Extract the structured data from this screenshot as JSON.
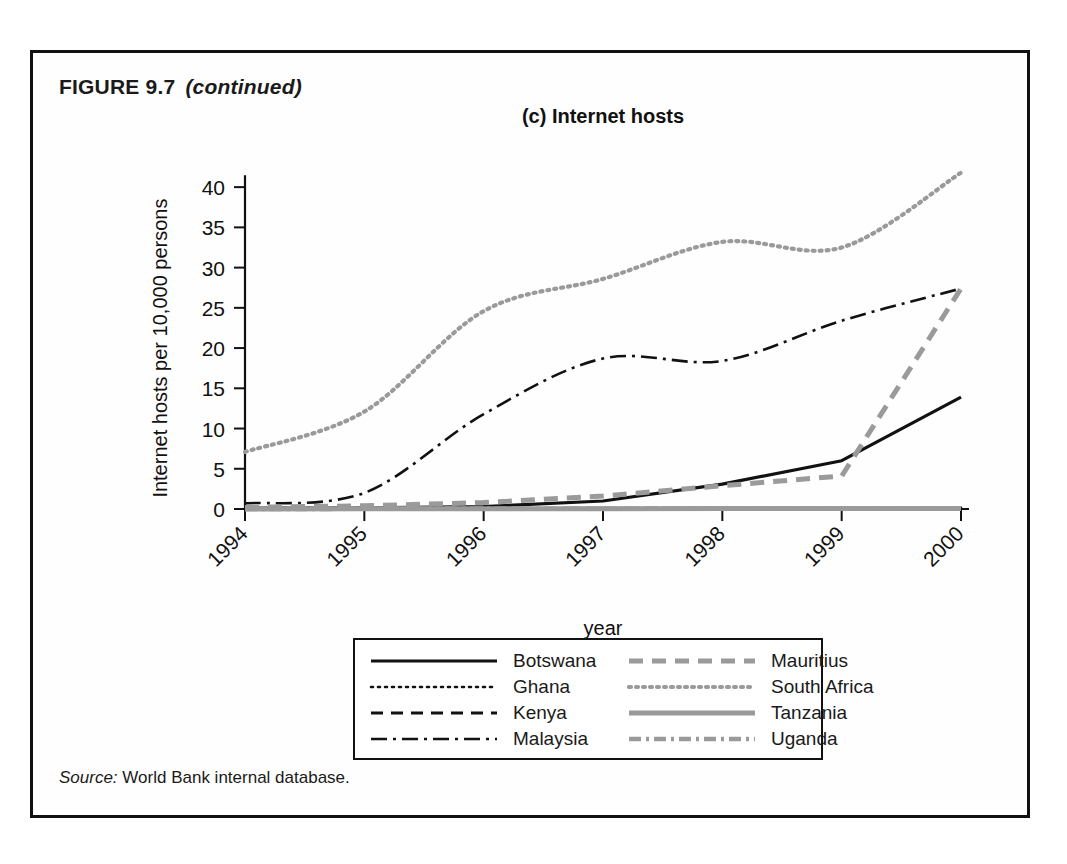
{
  "figure": {
    "label": "FIGURE 9.7",
    "continued": "(continued)",
    "source_prefix": "Source:",
    "source_text": "World Bank internal database."
  },
  "chart_data": {
    "type": "line",
    "title": "(c) Internet hosts",
    "xlabel": "year",
    "ylabel": "Internet hosts per 10,000 persons",
    "x": [
      1994,
      1995,
      1996,
      1997,
      1998,
      1999,
      2000
    ],
    "xticklabels": [
      "1994",
      "1995",
      "1996",
      "1997",
      "1998",
      "1999",
      "2000"
    ],
    "yticks": [
      0,
      5,
      10,
      15,
      20,
      25,
      30,
      35,
      40
    ],
    "yticklabels": [
      "0",
      "5",
      "10",
      "15",
      "20",
      "25",
      "30",
      "35",
      "40"
    ],
    "ylim": [
      0,
      43
    ],
    "xlim": [
      1994,
      2000
    ],
    "grid": false,
    "legend_position": "below-center",
    "legend_columns": 2,
    "series": [
      {
        "name": "Botswana",
        "style": "solid",
        "color": "#111111",
        "width": 3.2,
        "dash": "none",
        "values": [
          0.1,
          0.15,
          0.3,
          1.0,
          3.1,
          6.0,
          13.9
        ]
      },
      {
        "name": "Ghana",
        "style": "dotted",
        "color": "#111111",
        "width": 2.6,
        "dash": "2,5",
        "values": [
          0.02,
          0.03,
          0.05,
          0.07,
          0.1,
          0.12,
          0.15
        ]
      },
      {
        "name": "Kenya",
        "style": "dashed",
        "color": "#111111",
        "width": 3.0,
        "dash": "12,8",
        "values": [
          0.02,
          0.04,
          0.06,
          0.09,
          0.12,
          0.15,
          0.2
        ]
      },
      {
        "name": "Malaysia",
        "style": "dash-dot",
        "color": "#111111",
        "width": 2.6,
        "dash": "16,6,3,6",
        "values": [
          0.7,
          2.0,
          11.8,
          18.7,
          18.4,
          23.4,
          27.4
        ]
      },
      {
        "name": "Mauritius",
        "style": "dashed",
        "color": "#9a9a9a",
        "width": 5.0,
        "dash": "14,9",
        "values": [
          0.2,
          0.4,
          0.8,
          1.6,
          2.9,
          4.1,
          27.4
        ]
      },
      {
        "name": "South Africa",
        "style": "dotted",
        "color": "#9a9a9a",
        "width": 4.2,
        "dash": "2,5",
        "values": [
          7.1,
          12.1,
          24.6,
          28.6,
          33.2,
          32.5,
          41.8
        ]
      },
      {
        "name": "Tanzania",
        "style": "solid",
        "color": "#9a9a9a",
        "width": 5.0,
        "dash": "none",
        "values": [
          0.01,
          0.02,
          0.03,
          0.04,
          0.05,
          0.06,
          0.08
        ]
      },
      {
        "name": "Uganda",
        "style": "dash-dot",
        "color": "#9a9a9a",
        "width": 4.6,
        "dash": "12,5,3,5",
        "values": [
          0.01,
          0.02,
          0.03,
          0.04,
          0.05,
          0.07,
          0.1
        ]
      }
    ]
  }
}
